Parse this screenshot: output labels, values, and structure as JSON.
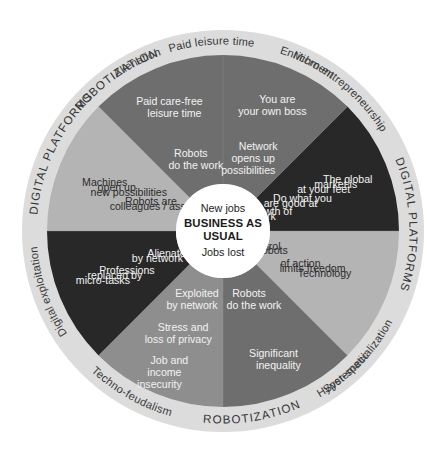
{
  "diagram": {
    "geometry": {
      "cx": 223,
      "cy": 231,
      "outer_radius": 201,
      "ring_inner_radius": 176,
      "hub_radius": 47
    },
    "colors": {
      "background": "#ffffff",
      "ring": "#dcdcdc",
      "hub": "#ffffff",
      "divider": "#9a9a9a",
      "tone_light": "#b4b4b4",
      "tone_medium": "#8e8e8e",
      "tone_dark": "#6e6e6e",
      "tone_darkest": "#282828",
      "text_on_dark": "#f2f2f2",
      "text_on_light": "#2b2b2b"
    },
    "hub": {
      "top_label": "New jobs",
      "center_line1": "BUSINESS AS",
      "center_line2": "USUAL",
      "bottom_label": "Jobs lost"
    },
    "ring_labels": [
      {
        "id": "robotization-top",
        "text": "ROBOTIZATION",
        "style": "caps",
        "start_angle": 220,
        "end_angle": 250
      },
      {
        "id": "paid-leisure-time",
        "text": "Paid leisure time",
        "style": "normal",
        "start_angle": 249,
        "end_angle": 284
      },
      {
        "id": "micro-entrepreneurship",
        "text": "Micro-entrepreneurship",
        "style": "normal",
        "start_angle": 287,
        "end_angle": 333
      },
      {
        "id": "digital-platforms-top",
        "text": "DIGITAL PLATFORMS",
        "style": "caps",
        "start_angle": 335,
        "end_angle": 381
      },
      {
        "id": "hyper-specialization",
        "text": "Hyper-specialization",
        "style": "normal",
        "start_angle": 383,
        "end_angle": 425
      },
      {
        "id": "systematic",
        "text": "Systematic",
        "style": "normal",
        "start_angle": 36,
        "end_angle": 62
      },
      {
        "id": "robotization-bottom",
        "text": "ROBOTIZATION",
        "style": "caps",
        "start_angle": 64,
        "end_angle": 98
      },
      {
        "id": "techno-feudalism",
        "text": "Techno-feudalism",
        "style": "normal",
        "start_angle": 100,
        "end_angle": 139
      },
      {
        "id": "digital-exploitation",
        "text": "Digital exploitation",
        "style": "normal",
        "start_angle": 141,
        "end_angle": 181
      },
      {
        "id": "digital-platforms-bottom",
        "text": "DIGITAL PLATFORMS",
        "style": "caps",
        "start_angle": 183,
        "end_angle": 228
      },
      {
        "id": "alienation",
        "text": "Alienation",
        "style": "normal",
        "start_angle": 230,
        "end_angle": 256
      },
      {
        "id": "enrichment",
        "text": "Enrichment",
        "style": "normal",
        "start_angle": 283,
        "end_angle": 310
      }
    ],
    "sectors": [
      {
        "id": "enrichment-sector",
        "ring_label": "Enrichment",
        "start_angle": 180,
        "end_angle": 225,
        "tone": "tone_light",
        "text_tone": "on-light",
        "lines": [
          {
            "text": "Machines",
            "r": 128
          },
          {
            "text": "open up",
            "r": 115
          },
          {
            "text": "new possibilities",
            "r": 102
          },
          {
            "text": "Robots are",
            "r": 78
          },
          {
            "text": "colleagues / assistants",
            "r": 65
          }
        ]
      },
      {
        "id": "paid-leisure-sector",
        "ring_label": "Paid leisure time",
        "start_angle": 225,
        "end_angle": 270,
        "tone": "tone_dark",
        "text_tone": "on-dark",
        "lines": [
          {
            "text": "Paid care-free",
            "r": 140
          },
          {
            "text": "leisure time",
            "r": 127
          },
          {
            "text": "Robots",
            "r": 84
          },
          {
            "text": "do the work",
            "r": 71
          }
        ]
      },
      {
        "id": "micro-entrepreneurship-sector",
        "ring_label": "Micro-entrepreneurship",
        "start_angle": 270,
        "end_angle": 315,
        "tone": "tone_dark",
        "text_tone": "on-dark",
        "lines": [
          {
            "text": "You are",
            "r": 142
          },
          {
            "text": "your own boss",
            "r": 129
          },
          {
            "text": "Network",
            "r": 92
          },
          {
            "text": "opens up",
            "r": 79
          },
          {
            "text": "possibilities",
            "r": 66
          }
        ]
      },
      {
        "id": "hyper-specialization-sector",
        "ring_label": "Hyper-specialization",
        "start_angle": 315,
        "end_angle": 360,
        "tone": "tone_darkest",
        "text_tone": "on-dark",
        "lines": [
          {
            "text": "The global",
            "r": 135
          },
          {
            "text": "market is",
            "r": 122
          },
          {
            "text": "at your feet",
            "r": 109
          },
          {
            "text": "Do what you",
            "r": 86
          },
          {
            "text": "are good at",
            "r": 73
          },
          {
            "text": "Growth of",
            "r": 50
          },
          {
            "text": "network",
            "r": 37
          }
        ]
      },
      {
        "id": "systematic-sector",
        "ring_label": "Systematic",
        "start_angle": 0,
        "end_angle": 45,
        "tone": "tone_light",
        "text_tone": "on-light",
        "lines": [
          {
            "text": "Robots",
            "r": 52
          },
          {
            "text": "in control",
            "r": 39
          },
          {
            "text": "Technology",
            "r": 110
          },
          {
            "text": "limits freedom",
            "r": 97
          },
          {
            "text": "of action",
            "r": 84
          }
        ]
      },
      {
        "id": "techno-feudalism-sector",
        "ring_label": "Techno-feudalism",
        "start_angle": 45,
        "end_angle": 90,
        "tone": "tone_dark",
        "text_tone": "on-dark",
        "lines": [
          {
            "text": "Robots",
            "r": 68
          },
          {
            "text": "do the work",
            "r": 81
          },
          {
            "text": "Significant",
            "r": 132
          },
          {
            "text": "inequality",
            "r": 145
          }
        ]
      },
      {
        "id": "digital-exploitation-sector",
        "ring_label": "Digital exploitation",
        "start_angle": 90,
        "end_angle": 135,
        "tone": "tone_medium",
        "text_tone": "on-dark",
        "lines": [
          {
            "text": "Exploited",
            "r": 68
          },
          {
            "text": "by network",
            "r": 81
          },
          {
            "text": "Stress and",
            "r": 104
          },
          {
            "text": "loss of privacy",
            "r": 117
          },
          {
            "text": "Job and",
            "r": 140
          },
          {
            "text": "income",
            "r": 153
          },
          {
            "text": "insecurity",
            "r": 166
          }
        ]
      },
      {
        "id": "alienation-sector",
        "ring_label": "Alienation",
        "start_angle": 135,
        "end_angle": 180,
        "tone": "tone_darkest",
        "text_tone": "on-dark",
        "lines": [
          {
            "text": "Alienated",
            "r": 58
          },
          {
            "text": "by network",
            "r": 71
          },
          {
            "text": "Professions",
            "r": 104
          },
          {
            "text": "replaced by",
            "r": 117
          },
          {
            "text": "micro-tasks",
            "r": 130
          }
        ]
      }
    ]
  }
}
